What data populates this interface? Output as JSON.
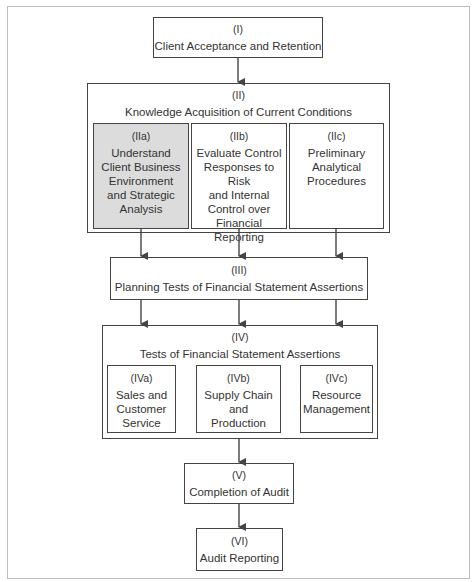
{
  "diagram": {
    "nodes": {
      "I": {
        "code": "(I)",
        "label": "Client Acceptance and Retention"
      },
      "II": {
        "code": "(II)",
        "label": "Knowledge Acquisition of Current Conditions"
      },
      "IIa": {
        "code": "(IIa)",
        "label": "Understand Client Business Environment and Strategic Analysis",
        "lines": [
          "Understand",
          "Client Business",
          "Environment",
          "and Strategic",
          "Analysis"
        ],
        "shaded": true
      },
      "IIb": {
        "code": "(IIb)",
        "label": "Evaluate Control Responses to Risk and Internal Control over Financial Reporting",
        "lines": [
          "Evaluate Control",
          "Responses to Risk",
          "and Internal",
          "Control over",
          "Financial",
          "Reporting"
        ]
      },
      "IIc": {
        "code": "(IIc)",
        "label": "Preliminary Analytical Procedures",
        "lines": [
          "Preliminary",
          "Analytical",
          "Procedures"
        ]
      },
      "III": {
        "code": "(III)",
        "label": "Planning Tests of Financial Statement Assertions"
      },
      "IV": {
        "code": "(IV)",
        "label": "Tests of Financial Statement Assertions"
      },
      "IVa": {
        "code": "(IVa)",
        "label": "Sales and Customer Service",
        "lines": [
          "Sales and",
          "Customer",
          "Service"
        ]
      },
      "IVb": {
        "code": "(IVb)",
        "label": "Supply Chain and Production",
        "lines": [
          "Supply Chain",
          "and",
          "Production"
        ]
      },
      "IVc": {
        "code": "(IVc)",
        "label": "Resource Management",
        "lines": [
          "Resource",
          "Management"
        ]
      },
      "V": {
        "code": "(V)",
        "label": "Completion of Audit"
      },
      "VI": {
        "code": "(VI)",
        "label": "Audit Reporting"
      }
    },
    "edges": [
      [
        "I",
        "II"
      ],
      [
        "IIa",
        "III"
      ],
      [
        "IIb",
        "III"
      ],
      [
        "IIc",
        "III"
      ],
      [
        "III",
        "IV"
      ],
      [
        "III",
        "IV"
      ],
      [
        "III",
        "IV"
      ],
      [
        "IV",
        "V"
      ],
      [
        "V",
        "VI"
      ]
    ],
    "colors": {
      "border": "#444444",
      "shaded_fill": "#dcdcdc",
      "frame": "#bdbdbd",
      "text": "#333333"
    }
  }
}
